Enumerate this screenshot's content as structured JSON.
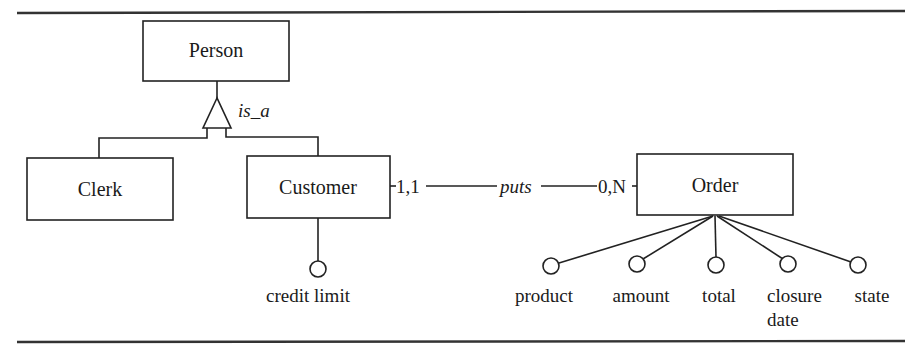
{
  "diagram": {
    "type": "entity-relationship",
    "entities": [
      {
        "id": "person",
        "label": "Person"
      },
      {
        "id": "clerk",
        "label": "Clerk"
      },
      {
        "id": "customer",
        "label": "Customer"
      },
      {
        "id": "order",
        "label": "Order"
      }
    ],
    "generalization": {
      "label": "is_a",
      "parent": "Person",
      "children": [
        "Clerk",
        "Customer"
      ]
    },
    "relationship": {
      "label": "puts",
      "left_entity": "Customer",
      "left_cardinality": "1,1",
      "right_entity": "Order",
      "right_cardinality": "0,N"
    },
    "customer_attributes": [
      {
        "label": "credit limit"
      }
    ],
    "order_attributes": [
      {
        "label": "product"
      },
      {
        "label": "amount"
      },
      {
        "label": "total"
      },
      {
        "label": "closure",
        "label2": "date"
      },
      {
        "label": "state"
      }
    ]
  }
}
